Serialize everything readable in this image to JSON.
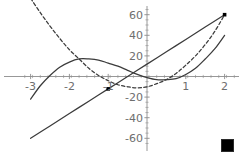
{
  "figure": {
    "width": 243,
    "height": 157,
    "background": "#ffffff",
    "axis_color": "#8c8c8c",
    "curve_color": "#3b3b3b",
    "label_color": "#6e6e6e",
    "marker_color": "#000000"
  },
  "corner_marker": {
    "name": "selection-square",
    "color": "#000000",
    "x": 221,
    "y": 139,
    "size": 11
  },
  "chart_data": {
    "type": "line",
    "title": "",
    "subtitle": "",
    "xlabel": "",
    "ylabel": "",
    "xlim": [
      -3.15,
      2.25
    ],
    "ylim": [
      -66,
      66
    ],
    "grid": false,
    "legend": "none",
    "x_ticks": [
      -3,
      -2,
      -1,
      1,
      2
    ],
    "x_tick_labels": [
      "-3",
      "-2",
      "-1",
      "1",
      "2"
    ],
    "y_ticks": [
      60,
      40,
      20,
      -20,
      -40,
      -60
    ],
    "y_tick_labels": [
      "60",
      "40",
      "20",
      "-20",
      "-40",
      "-60"
    ],
    "x_minor_tick_step": 0.2,
    "y_minor_tick_step": 5,
    "series": [
      {
        "name": "straight-line",
        "style": "solid",
        "color": "#3b3b3b",
        "x": [
          -3,
          -2.5,
          -2,
          -1.5,
          -1,
          -0.5,
          0,
          0.5,
          1,
          1.5,
          2
        ],
        "values": [
          -60,
          -48,
          -36,
          -24,
          -12,
          0,
          12,
          24,
          36,
          48,
          60
        ]
      },
      {
        "name": "dashed-curve",
        "style": "dashed",
        "color": "#3b3b3b",
        "x": [
          -3,
          -2.75,
          -2.5,
          -2.25,
          -2,
          -1.75,
          -1.5,
          -1.25,
          -1,
          -0.75,
          -0.5,
          -0.25,
          0,
          0.25,
          0.5,
          0.75,
          1,
          1.25,
          1.5,
          1.75,
          2
        ],
        "values": [
          76,
          62,
          49,
          37,
          26,
          17,
          8,
          1,
          -4,
          -8,
          -10,
          -11,
          -10,
          -7,
          -3,
          3,
          11,
          20,
          31,
          44,
          60
        ]
      },
      {
        "name": "solid-cubic",
        "style": "solid",
        "color": "#3b3b3b",
        "x": [
          -3,
          -2.75,
          -2.5,
          -2.25,
          -2,
          -1.75,
          -1.5,
          -1.25,
          -1,
          -0.75,
          -0.5,
          -0.25,
          0,
          0.25,
          0.5,
          0.75,
          1,
          1.25,
          1.5,
          1.75,
          2
        ],
        "values": [
          -22,
          -9,
          1,
          9,
          14,
          17,
          17,
          16,
          13,
          10,
          6,
          2,
          -1,
          -3,
          -3,
          -2,
          2,
          8,
          17,
          27,
          40
        ]
      }
    ],
    "points": [
      {
        "name": "point-marker-left",
        "x": -1,
        "y": -12
      },
      {
        "name": "point-marker-right",
        "x": 2,
        "y": 60
      }
    ]
  }
}
